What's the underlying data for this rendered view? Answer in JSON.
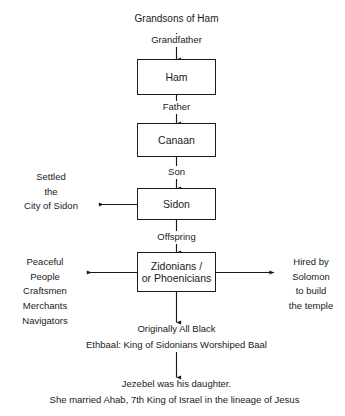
{
  "diagram": {
    "title": "Grandsons of Ham",
    "nodes": [
      {
        "id": "ham",
        "label": "Ham"
      },
      {
        "id": "canaan",
        "label": "Canaan"
      },
      {
        "id": "sidon",
        "label": "Sidon"
      },
      {
        "id": "zidonians",
        "label": "Zidonians /\nor Phoenicians"
      }
    ],
    "edge_labels": [
      {
        "id": "grandfather",
        "label": "Grandfather"
      },
      {
        "id": "father",
        "label": "Father"
      },
      {
        "id": "son",
        "label": "Son"
      },
      {
        "id": "offspring",
        "label": "Offspring"
      }
    ],
    "side_notes": [
      {
        "id": "settled-sidon",
        "label": "Settled\nthe\nCity of Sidon"
      },
      {
        "id": "peaceful-people",
        "label": "Peaceful\nPeople\nCraftsmen\nMerchants\nNavigators"
      },
      {
        "id": "hired-by-solomon",
        "label": "Hired by\nSolomon\nto build\nthe temple"
      }
    ],
    "notes": [
      {
        "id": "originally-all-black",
        "label": "Originally All Black"
      },
      {
        "id": "ethbaal",
        "label": "Ethbaal: King of Sidonians Worshiped Baal"
      },
      {
        "id": "jezebel-daughter",
        "label": "Jezebel was his daughter."
      },
      {
        "id": "jezebel-ahab",
        "label": "She married Ahab, 7th King of Israel in the lineage of Jesus"
      }
    ],
    "colors": {
      "ink": "#1a1a1a",
      "background": "#ffffff"
    }
  }
}
